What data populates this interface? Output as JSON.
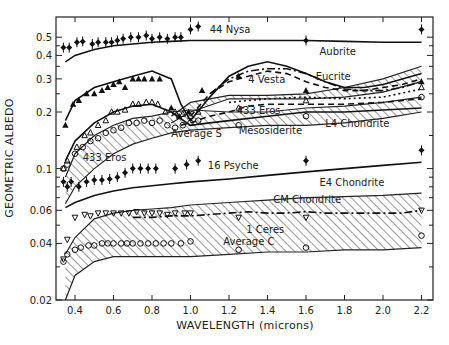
{
  "chart_data": {
    "type": "line",
    "title": "",
    "xlabel": "WAVELENGTH (microns)",
    "ylabel": "GEOMETRIC ALBEDO",
    "xscale": "linear",
    "yscale": "log",
    "xlim": [
      0.3,
      2.26
    ],
    "ylim": [
      0.02,
      0.62
    ],
    "xticks": [
      0.4,
      0.6,
      0.8,
      1.0,
      1.2,
      1.4,
      1.6,
      1.8,
      2.0,
      2.2
    ],
    "xtick_labels": [
      "0.4",
      "0.6",
      "0.8",
      "1.0",
      "1.2",
      "1.4",
      "1.6",
      "1.8",
      "2.0",
      "2.2"
    ],
    "yticks": [
      0.02,
      0.04,
      0.06,
      0.1,
      0.2,
      0.3,
      0.4,
      0.5
    ],
    "ytick_labels": [
      "0.02",
      "0.04",
      "0.06",
      "0.1",
      "0.2",
      "0.3",
      "0.4",
      "0.5"
    ],
    "grid": false,
    "legend": "none (inline annotations)",
    "bands": [
      {
        "name": "Eucrite",
        "x": [
          0.9,
          1.0,
          1.2,
          1.4,
          1.6,
          1.8,
          2.0,
          2.2
        ],
        "lower": [
          0.175,
          0.2,
          0.235,
          0.235,
          0.235,
          0.24,
          0.255,
          0.29
        ],
        "upper": [
          0.19,
          0.225,
          0.245,
          0.245,
          0.25,
          0.27,
          0.3,
          0.35
        ]
      },
      {
        "name": "Mesosiderite / L4 Chondrite",
        "x": [
          0.35,
          0.4,
          0.5,
          0.6,
          0.7,
          0.8,
          0.9,
          1.0,
          1.2,
          1.4,
          1.6,
          1.8,
          2.0,
          2.2
        ],
        "lower": [
          0.065,
          0.08,
          0.1,
          0.12,
          0.135,
          0.145,
          0.155,
          0.16,
          0.165,
          0.17,
          0.17,
          0.175,
          0.185,
          0.2
        ],
        "upper": [
          0.09,
          0.12,
          0.15,
          0.17,
          0.185,
          0.19,
          0.2,
          0.205,
          0.2,
          0.2,
          0.21,
          0.215,
          0.225,
          0.24
        ]
      },
      {
        "name": "CM Chondrite",
        "x": [
          0.35,
          0.4,
          0.5,
          0.6,
          0.7,
          0.8,
          0.9,
          1.0,
          1.2,
          1.4,
          1.6,
          1.8,
          2.0,
          2.2
        ],
        "lower": [
          0.02,
          0.027,
          0.032,
          0.034,
          0.034,
          0.034,
          0.034,
          0.034,
          0.035,
          0.036,
          0.036,
          0.037,
          0.037,
          0.038
        ],
        "upper": [
          0.035,
          0.043,
          0.054,
          0.058,
          0.06,
          0.061,
          0.062,
          0.064,
          0.066,
          0.068,
          0.07,
          0.071,
          0.072,
          0.074
        ]
      }
    ],
    "series": [
      {
        "name": "Aubrite",
        "style": "solid",
        "x": [
          0.35,
          0.4,
          0.5,
          0.6,
          0.7,
          0.8,
          0.9,
          1.0,
          1.2,
          1.4,
          1.6,
          1.8,
          2.0,
          2.2
        ],
        "values": [
          0.37,
          0.4,
          0.43,
          0.45,
          0.46,
          0.47,
          0.475,
          0.48,
          0.48,
          0.48,
          0.48,
          0.475,
          0.47,
          0.47
        ]
      },
      {
        "name": "Eucrite (solid)",
        "style": "solid",
        "x": [
          0.35,
          0.4,
          0.5,
          0.6,
          0.7,
          0.8,
          0.9,
          0.95,
          1.0,
          1.1,
          1.2,
          1.3,
          1.4,
          1.5,
          1.6,
          1.7,
          1.8,
          1.9,
          2.0,
          2.1,
          2.2
        ],
        "values": [
          0.18,
          0.23,
          0.27,
          0.29,
          0.31,
          0.33,
          0.3,
          0.22,
          0.18,
          0.24,
          0.31,
          0.35,
          0.37,
          0.35,
          0.32,
          0.29,
          0.27,
          0.27,
          0.28,
          0.3,
          0.32
        ]
      },
      {
        "name": "4 Vesta (dash)",
        "style": "dash",
        "x": [
          1.0,
          1.1,
          1.2,
          1.3,
          1.4,
          1.5,
          1.6,
          1.7,
          1.8,
          1.9,
          2.0,
          2.1,
          2.2
        ],
        "values": [
          0.19,
          0.25,
          0.29,
          0.31,
          0.33,
          0.32,
          0.29,
          0.27,
          0.26,
          0.26,
          0.27,
          0.28,
          0.3
        ]
      },
      {
        "name": "Dash-dot (S-type)",
        "style": "dashdot",
        "x": [
          1.1,
          1.2,
          1.3,
          1.4,
          1.5,
          1.6,
          1.7,
          1.8,
          1.9,
          2.0,
          2.1,
          2.2
        ],
        "values": [
          0.25,
          0.3,
          0.33,
          0.34,
          0.34,
          0.32,
          0.29,
          0.265,
          0.26,
          0.26,
          0.27,
          0.29
        ]
      },
      {
        "name": "433 Eros (dash)",
        "style": "dash",
        "x": [
          0.95,
          1.0,
          1.1,
          1.2,
          1.3,
          1.4,
          1.6,
          1.8,
          2.0,
          2.2
        ],
        "values": [
          0.17,
          0.175,
          0.19,
          0.2,
          0.215,
          0.22,
          0.22,
          0.22,
          0.225,
          0.235
        ]
      },
      {
        "name": "Mesosiderite dotted",
        "style": "dotted",
        "x": [
          1.2,
          1.4,
          1.6,
          1.8,
          2.0,
          2.2
        ],
        "values": [
          0.225,
          0.235,
          0.24,
          0.235,
          0.24,
          0.265
        ]
      },
      {
        "name": "Average S (solid)",
        "style": "solid",
        "x": [
          0.35,
          0.4,
          0.5,
          0.6,
          0.7,
          0.8,
          0.9,
          1.0,
          1.1,
          1.2,
          1.4,
          1.6,
          1.8,
          2.0,
          2.2
        ],
        "values": [
          0.11,
          0.14,
          0.175,
          0.2,
          0.215,
          0.22,
          0.2,
          0.17,
          0.175,
          0.18,
          0.19,
          0.2,
          0.2,
          0.205,
          0.21
        ]
      },
      {
        "name": "E4 Chondrite",
        "style": "solid",
        "x": [
          0.35,
          0.4,
          0.5,
          0.6,
          0.7,
          0.8,
          0.9,
          1.0,
          1.2,
          1.4,
          1.6,
          1.8,
          2.0,
          2.2
        ],
        "values": [
          0.062,
          0.066,
          0.072,
          0.076,
          0.079,
          0.081,
          0.083,
          0.085,
          0.088,
          0.092,
          0.096,
          0.1,
          0.104,
          0.108
        ]
      },
      {
        "name": "1 Ceres (dash-dot)",
        "style": "dashdot",
        "x": [
          0.7,
          0.8,
          0.9,
          1.0,
          1.1,
          1.2,
          1.3,
          1.4,
          1.5,
          1.6,
          1.7,
          1.8,
          1.9,
          2.0,
          2.1,
          2.2
        ],
        "values": [
          0.055,
          0.055,
          0.056,
          0.056,
          0.057,
          0.058,
          0.059,
          0.058,
          0.058,
          0.059,
          0.058,
          0.058,
          0.058,
          0.058,
          0.058,
          0.06
        ]
      }
    ],
    "points": [
      {
        "name": "44 Nysa",
        "marker": "filled-diamond",
        "x": [
          0.34,
          0.37,
          0.41,
          0.44,
          0.49,
          0.52,
          0.56,
          0.59,
          0.62,
          0.65,
          0.69,
          0.73,
          0.77,
          0.8,
          0.84,
          0.88,
          0.92,
          0.95,
          1.0,
          1.04,
          1.6,
          2.2
        ],
        "values": [
          0.44,
          0.44,
          0.47,
          0.475,
          0.46,
          0.47,
          0.47,
          0.47,
          0.48,
          0.49,
          0.5,
          0.5,
          0.51,
          0.49,
          0.5,
          0.49,
          0.5,
          0.5,
          0.55,
          0.57,
          0.48,
          0.55
        ]
      },
      {
        "name": "4 Vesta",
        "marker": "filled-triangle",
        "x": [
          0.35,
          0.39,
          0.42,
          0.46,
          0.5,
          0.54,
          0.57,
          0.6,
          0.63,
          0.66,
          0.7,
          0.73,
          0.76,
          0.8,
          0.84,
          0.9,
          0.94,
          0.99,
          1.06,
          1.25,
          1.6,
          2.2
        ],
        "values": [
          0.17,
          0.22,
          0.23,
          0.25,
          0.25,
          0.26,
          0.27,
          0.28,
          0.29,
          0.27,
          0.3,
          0.3,
          0.3,
          0.3,
          0.3,
          0.21,
          0.19,
          0.2,
          0.26,
          0.31,
          0.26,
          0.29
        ]
      },
      {
        "name": "433 Eros",
        "marker": "open-triangle",
        "x": [
          0.34,
          0.36,
          0.41,
          0.45,
          0.48,
          0.52,
          0.56,
          0.59,
          0.62,
          0.66,
          0.7,
          0.73,
          0.77,
          0.8,
          0.83,
          0.87,
          0.92,
          0.96,
          1.0,
          1.04,
          1.25,
          1.6,
          2.2
        ],
        "values": [
          0.1,
          0.11,
          0.13,
          0.15,
          0.155,
          0.17,
          0.18,
          0.2,
          0.2,
          0.205,
          0.22,
          0.22,
          0.225,
          0.225,
          0.22,
          0.2,
          0.2,
          0.195,
          0.19,
          0.2,
          0.21,
          0.23,
          0.27
        ]
      },
      {
        "name": "Average S",
        "marker": "open-circle",
        "x": [
          0.34,
          0.36,
          0.4,
          0.44,
          0.48,
          0.52,
          0.56,
          0.6,
          0.64,
          0.68,
          0.72,
          0.76,
          0.8,
          0.84,
          0.88,
          0.92,
          0.96,
          1.0,
          1.04,
          1.25,
          1.6,
          2.2
        ],
        "values": [
          0.1,
          0.105,
          0.12,
          0.13,
          0.14,
          0.145,
          0.155,
          0.16,
          0.165,
          0.175,
          0.175,
          0.18,
          0.175,
          0.18,
          0.17,
          0.165,
          0.17,
          0.175,
          0.18,
          0.17,
          0.19,
          0.24
        ]
      },
      {
        "name": "16 Psyche",
        "marker": "filled-diamond",
        "x": [
          0.34,
          0.36,
          0.38,
          0.42,
          0.46,
          0.5,
          0.54,
          0.58,
          0.62,
          0.66,
          0.7,
          0.74,
          0.78,
          0.82,
          0.92,
          0.98,
          1.04,
          1.6,
          2.2
        ],
        "values": [
          0.085,
          0.08,
          0.085,
          0.08,
          0.085,
          0.087,
          0.087,
          0.088,
          0.09,
          0.095,
          0.1,
          0.1,
          0.1,
          0.1,
          0.1,
          0.105,
          0.11,
          0.11,
          0.125
        ]
      },
      {
        "name": "1 Ceres",
        "marker": "open-inverted-triangle",
        "x": [
          0.34,
          0.36,
          0.4,
          0.45,
          0.48,
          0.52,
          0.56,
          0.6,
          0.64,
          0.68,
          0.72,
          0.76,
          0.8,
          0.84,
          0.88,
          0.92,
          0.97,
          1.0,
          1.25,
          1.6,
          2.2
        ],
        "values": [
          0.033,
          0.042,
          0.055,
          0.057,
          0.056,
          0.058,
          0.058,
          0.058,
          0.058,
          0.058,
          0.059,
          0.058,
          0.058,
          0.058,
          0.057,
          0.058,
          0.058,
          0.058,
          0.055,
          0.055,
          0.06
        ]
      },
      {
        "name": "Average C",
        "marker": "open-circle",
        "x": [
          0.34,
          0.36,
          0.4,
          0.43,
          0.47,
          0.5,
          0.54,
          0.57,
          0.6,
          0.64,
          0.67,
          0.7,
          0.74,
          0.78,
          0.82,
          0.86,
          0.9,
          0.95,
          1.0,
          1.25,
          1.6,
          2.2
        ],
        "values": [
          0.032,
          0.035,
          0.037,
          0.038,
          0.039,
          0.039,
          0.04,
          0.04,
          0.04,
          0.04,
          0.04,
          0.04,
          0.04,
          0.04,
          0.04,
          0.04,
          0.04,
          0.04,
          0.041,
          0.037,
          0.038,
          0.044
        ]
      }
    ],
    "annotations": [
      {
        "text": "44 Nysa",
        "x": 1.1,
        "y": 0.55
      },
      {
        "text": "Aubrite",
        "x": 1.67,
        "y": 0.42
      },
      {
        "text": "4 Vesta",
        "x": 1.3,
        "y": 0.3
      },
      {
        "text": "Eucrite",
        "x": 1.65,
        "y": 0.31
      },
      {
        "text": "433 Eros",
        "x": 1.24,
        "y": 0.205
      },
      {
        "text": "433 Eros",
        "x": 0.44,
        "y": 0.115
      },
      {
        "text": "Average S",
        "x": 0.9,
        "y": 0.155
      },
      {
        "text": "Mesosiderite",
        "x": 1.25,
        "y": 0.16
      },
      {
        "text": "L4 Chondrite",
        "x": 1.7,
        "y": 0.175
      },
      {
        "text": "16 Psyche",
        "x": 1.09,
        "y": 0.105
      },
      {
        "text": "E4 Chondrite",
        "x": 1.67,
        "y": 0.085
      },
      {
        "text": "CM Chondrite",
        "x": 1.43,
        "y": 0.069
      },
      {
        "text": "1 Ceres",
        "x": 1.29,
        "y": 0.048
      },
      {
        "text": "Average C",
        "x": 1.17,
        "y": 0.041
      }
    ]
  }
}
